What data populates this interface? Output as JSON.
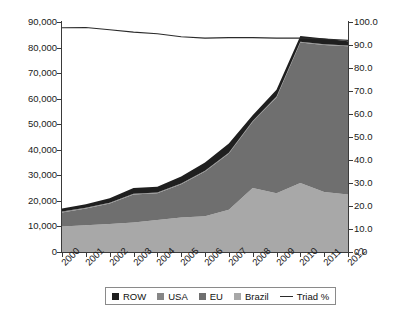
{
  "chart_data": {
    "type": "area",
    "title": "",
    "subtitle": "",
    "xlabel": "",
    "ylabel": "",
    "y2label": "",
    "stacked": true,
    "grid": false,
    "legend_position": "bottom",
    "categories": [
      "2000",
      "2001",
      "2002",
      "2003",
      "2004",
      "2005",
      "2006",
      "2007",
      "2008",
      "2009",
      "2010",
      "2011",
      "2012"
    ],
    "ylim": [
      0,
      90000
    ],
    "yticks": [
      0,
      10000,
      20000,
      30000,
      40000,
      50000,
      60000,
      70000,
      80000,
      90000
    ],
    "ytick_labels": [
      "0",
      "10,000",
      "20,000",
      "30,000",
      "40,000",
      "50,000",
      "60,000",
      "70,000",
      "80,000",
      "90,000"
    ],
    "y2lim": [
      0,
      100
    ],
    "y2ticks": [
      0,
      10,
      20,
      30,
      40,
      50,
      60,
      70,
      80,
      90,
      100
    ],
    "y2tick_labels": [
      "0.0",
      "10.0",
      "20.0",
      "30.0",
      "40.0",
      "50.0",
      "60.0",
      "70.0",
      "80.0",
      "90.0",
      "100.0"
    ],
    "series": [
      {
        "name": "Brazil",
        "color": "#a8a8a8",
        "axis": "left",
        "stack_order": 1,
        "values": [
          10000,
          10500,
          11000,
          11500,
          12500,
          13500,
          14000,
          16500,
          25000,
          23000,
          27000,
          23500,
          22500
        ]
      },
      {
        "name": "EU",
        "color": "#6f6f6f",
        "axis": "left",
        "stack_order": 2,
        "values": [
          5500,
          6500,
          8000,
          11000,
          10500,
          13000,
          17500,
          22000,
          26000,
          37500,
          55000,
          57500,
          58000
        ]
      },
      {
        "name": "USA",
        "color": "#868686",
        "axis": "left",
        "stack_order": 3,
        "values": [
          300,
          300,
          300,
          300,
          300,
          300,
          300,
          300,
          300,
          300,
          300,
          300,
          300
        ]
      },
      {
        "name": "ROW",
        "color": "#1f1f1f",
        "axis": "left",
        "stack_order": 4,
        "values": [
          1200,
          1400,
          1700,
          2200,
          2200,
          2700,
          3200,
          3700,
          2200,
          2700,
          2200,
          2200,
          1700
        ]
      }
    ],
    "line_series": [
      {
        "name": "Triad %",
        "color": "#2b2b2b",
        "axis": "right",
        "values": [
          97.5,
          97.6,
          96.6,
          95.6,
          94.9,
          93.6,
          93.0,
          93.2,
          93.2,
          93.0,
          93.0,
          92.6,
          92.0
        ]
      }
    ],
    "totals": [
      17000,
      18700,
      21000,
      25000,
      25500,
      29500,
      35000,
      42500,
      53500,
      63500,
      84500,
      83500,
      82500
    ]
  },
  "axes": {
    "left_ticks": [
      {
        "label": "90,000",
        "value": 90000
      },
      {
        "label": "80,000",
        "value": 80000
      },
      {
        "label": "70,000",
        "value": 70000
      },
      {
        "label": "60,000",
        "value": 60000
      },
      {
        "label": "50,000",
        "value": 50000
      },
      {
        "label": "40,000",
        "value": 40000
      },
      {
        "label": "30,000",
        "value": 30000
      },
      {
        "label": "20,000",
        "value": 20000
      },
      {
        "label": "10,000",
        "value": 10000
      },
      {
        "label": "0",
        "value": 0
      }
    ],
    "right_ticks": [
      {
        "label": "100.0",
        "value": 100
      },
      {
        "label": "90.0",
        "value": 90
      },
      {
        "label": "80.0",
        "value": 80
      },
      {
        "label": "70.0",
        "value": 70
      },
      {
        "label": "60.0",
        "value": 60
      },
      {
        "label": "50.0",
        "value": 50
      },
      {
        "label": "40.0",
        "value": 40
      },
      {
        "label": "30.0",
        "value": 30
      },
      {
        "label": "20.0",
        "value": 20
      },
      {
        "label": "10.0",
        "value": 10
      },
      {
        "label": "0.0",
        "value": 0
      }
    ],
    "x_ticks": [
      "2000",
      "2001",
      "2002",
      "2003",
      "2004",
      "2005",
      "2006",
      "2007",
      "2008",
      "2009",
      "2010",
      "2011",
      "2012"
    ]
  },
  "legend": {
    "items": [
      {
        "label": "ROW",
        "color": "#1f1f1f",
        "marker": "square"
      },
      {
        "label": "USA",
        "color": "#868686",
        "marker": "square"
      },
      {
        "label": "EU",
        "color": "#6f6f6f",
        "marker": "square"
      },
      {
        "label": "Brazil",
        "color": "#a8a8a8",
        "marker": "square"
      },
      {
        "label": "Triad %",
        "color": "#2b2b2b",
        "marker": "line"
      }
    ]
  }
}
